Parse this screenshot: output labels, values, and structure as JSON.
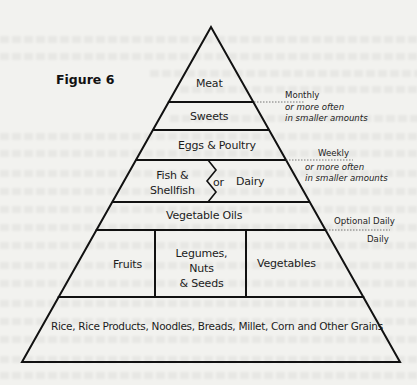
{
  "figure": {
    "title": "Figure 6"
  },
  "pyramid": {
    "tiers": {
      "meat": "Meat",
      "sweets": "Sweets",
      "eggs_poultry": "Eggs & Poultry",
      "fish_line1": "Fish &",
      "fish_line2": "Shellfish",
      "or": "or",
      "dairy": "Dairy",
      "vegetable_oils": "Vegetable Oils",
      "fruits": "Fruits",
      "legumes_line1": "Legumes,",
      "legumes_line2": "Nuts",
      "legumes_line3": "& Seeds",
      "vegetables": "Vegetables",
      "grains": "Rice, Rice Products, Noodles, Breads, Millet, Corn and Other Grains"
    }
  },
  "frequency_notes": {
    "monthly": "Monthly",
    "monthly_sub1": "or more often",
    "monthly_sub2": "in smaller amounts",
    "weekly": "Weekly",
    "weekly_sub1": "or more often",
    "weekly_sub2": "in smaller amounts",
    "optional_daily": "Optional Daily",
    "daily": "Daily"
  },
  "colors": {
    "background": "#f2f2ef",
    "line": "#111111"
  }
}
